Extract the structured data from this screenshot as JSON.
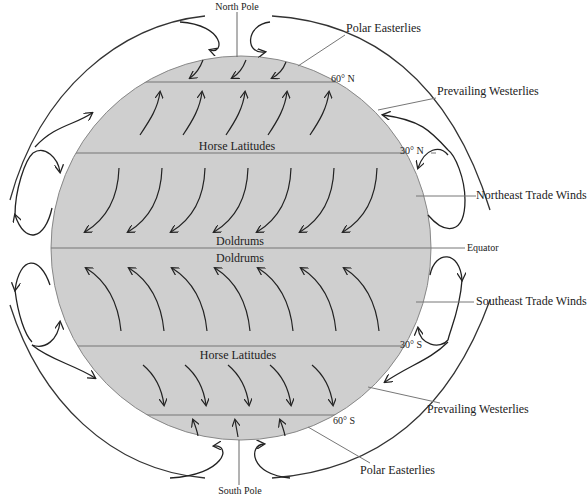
{
  "diagram": {
    "colors": {
      "globe_fill": "#cfcfcf",
      "line": "#333333",
      "leader": "#666666",
      "background": "#ffffff"
    },
    "poles": {
      "north": "North Pole",
      "south": "South Pole"
    },
    "latitudes": {
      "n60": "60° N",
      "n30": "30° N",
      "equator": "Equator",
      "s30": "30° S",
      "s60": "60° S"
    },
    "zones": {
      "horse_north": "Horse Latitudes",
      "doldrums_north": "Doldrums",
      "doldrums_south": "Doldrums",
      "horse_south": "Horse Latitudes"
    },
    "winds": {
      "polar_easterlies_north": "Polar Easterlies",
      "prevailing_westerlies_north": "Prevailing Westerlies",
      "northeast_trades": "Northeast Trade Winds",
      "southeast_trades": "Southeast Trade Winds",
      "prevailing_westerlies_south": "Prevailing Westerlies",
      "polar_easterlies_south": "Polar Easterlies"
    }
  }
}
